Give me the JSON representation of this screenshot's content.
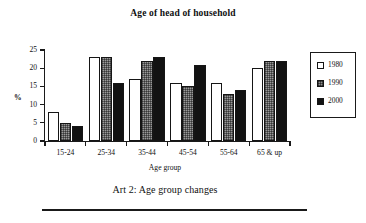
{
  "chart_data": {
    "type": "bar",
    "title": "Age of head of household",
    "xlabel": "Age group",
    "ylabel": "%",
    "categories": [
      "15-24",
      "25-34",
      "35-44",
      "45-54",
      "55-64",
      "65 & up"
    ],
    "series": [
      {
        "name": "1980",
        "values": [
          8,
          23,
          17,
          16,
          16,
          20
        ],
        "color": "#ffffff"
      },
      {
        "name": "1990",
        "values": [
          5,
          23,
          22,
          15,
          13,
          22
        ],
        "color": "#9a9a9a"
      },
      {
        "name": "2000",
        "values": [
          4,
          16,
          23,
          21,
          14,
          22
        ],
        "color": "#121212"
      }
    ],
    "ylim": [
      0,
      25
    ],
    "yticks": [
      0,
      5,
      10,
      15,
      20,
      25
    ],
    "ytick_labels": [
      "0",
      "5",
      "10",
      "15",
      "20",
      "25"
    ],
    "grid": false,
    "legend_position": "right"
  },
  "caption": "Art 2: Age group changes"
}
